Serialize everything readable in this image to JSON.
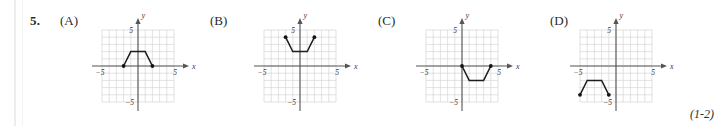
{
  "question": {
    "number": "5.",
    "footnote_reference": "(1-2)"
  },
  "axis_labels": {
    "x": "x",
    "y": "y",
    "x_neg_tick": "−5",
    "x_pos_tick": "5",
    "y_pos_tick": "5",
    "y_neg_tick": "−5"
  },
  "colors": {
    "grid": "#cfcfcf",
    "axis": "#555555",
    "curve": "#1d1d1d",
    "text": "#2a2a2a",
    "background": "#ffffff"
  },
  "panels": [
    {
      "label": "(A)",
      "chart_data": {
        "type": "line",
        "title": "(A)",
        "xlabel": "x",
        "ylabel": "y",
        "xlim": [
          -5,
          5
        ],
        "ylim": [
          -5,
          5
        ],
        "grid": true,
        "xticks": [
          -5,
          5
        ],
        "yticks": [
          -5,
          5
        ],
        "series": [
          {
            "name": "trapezoid-above-axis",
            "points": [
              [
                -2,
                0
              ],
              [
                -1,
                2
              ],
              [
                1,
                2
              ],
              [
                2,
                0
              ]
            ],
            "endpoints": [
              [
                -2,
                0
              ],
              [
                2,
                0
              ]
            ]
          }
        ]
      }
    },
    {
      "label": "(B)",
      "chart_data": {
        "type": "line",
        "title": "(B)",
        "xlabel": "x",
        "ylabel": "y",
        "xlim": [
          -5,
          5
        ],
        "ylim": [
          -5,
          5
        ],
        "grid": true,
        "xticks": [
          -5,
          5
        ],
        "yticks": [
          -5,
          5
        ],
        "series": [
          {
            "name": "trapezoid-opening-upward",
            "points": [
              [
                -2,
                4
              ],
              [
                -1,
                2
              ],
              [
                1,
                2
              ],
              [
                2,
                4
              ]
            ],
            "endpoints": [
              [
                -2,
                4
              ],
              [
                2,
                4
              ]
            ]
          }
        ]
      }
    },
    {
      "label": "(C)",
      "chart_data": {
        "type": "line",
        "title": "(C)",
        "xlabel": "x",
        "ylabel": "y",
        "xlim": [
          -5,
          5
        ],
        "ylim": [
          -5,
          5
        ],
        "grid": true,
        "xticks": [
          -5,
          5
        ],
        "yticks": [
          -5,
          5
        ],
        "series": [
          {
            "name": "trapezoid-below-axis",
            "points": [
              [
                0,
                0
              ],
              [
                1,
                -2
              ],
              [
                3,
                -2
              ],
              [
                4,
                0
              ]
            ],
            "endpoints": [
              [
                0,
                0
              ],
              [
                4,
                0
              ]
            ]
          }
        ]
      }
    },
    {
      "label": "(D)",
      "chart_data": {
        "type": "line",
        "title": "(D)",
        "xlabel": "x",
        "ylabel": "y",
        "xlim": [
          -5,
          5
        ],
        "ylim": [
          -5,
          5
        ],
        "grid": true,
        "xticks": [
          -5,
          5
        ],
        "yticks": [
          -5,
          5
        ],
        "series": [
          {
            "name": "trapezoid-third-quadrant",
            "points": [
              [
                -5,
                -4
              ],
              [
                -4,
                -2
              ],
              [
                -2,
                -2
              ],
              [
                -1,
                -4
              ]
            ],
            "endpoints": [
              [
                -5,
                -4
              ],
              [
                -1,
                -4
              ]
            ]
          }
        ]
      }
    }
  ]
}
